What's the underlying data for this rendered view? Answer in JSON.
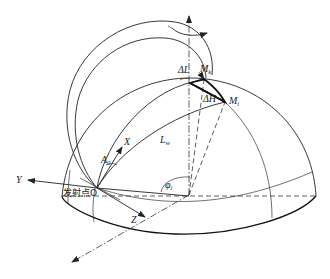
{
  "diagram": {
    "type": "geometry-schematic",
    "labels": {
      "y_axis": "Y",
      "x_axis": "X",
      "z_axis": "Z",
      "launch_point": "发射点O",
      "azimuth": "A",
      "azimuth_sub": "0",
      "range": "L",
      "range_sub": "w",
      "delta_L": "ΔL",
      "delta_H": "ΔH",
      "point_k": "M",
      "point_k_sub": "k",
      "point_i": "M",
      "point_i_sub": "i",
      "angle": "φ",
      "angle_sub": "i"
    },
    "colors": {
      "stroke": "#222222",
      "background": "#ffffff"
    }
  }
}
